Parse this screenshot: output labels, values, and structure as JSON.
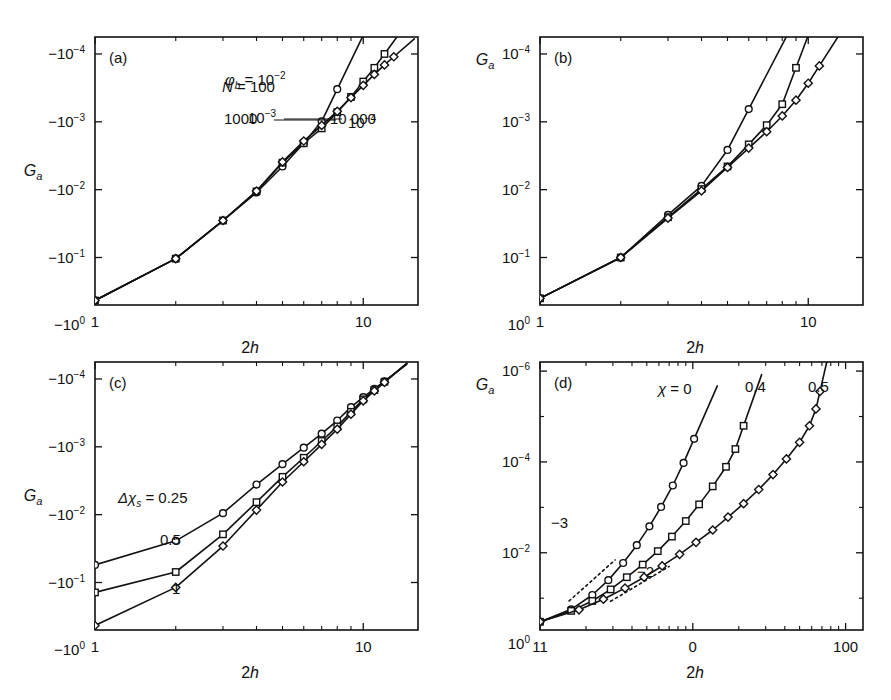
{
  "figure": {
    "background": "#ffffff",
    "ink": "#111111",
    "width": 891,
    "height": 700
  },
  "chart_data": [
    {
      "id": "panel-a",
      "type": "line",
      "tag": "(a)",
      "title": "",
      "xlabel": "2h",
      "ylabel": "Ga",
      "ylabel_parts": {
        "base": "G",
        "sub": "a"
      },
      "xscale": "log",
      "yscale": "log-negative",
      "xlim": [
        1,
        16
      ],
      "ylim_exp": [
        -0.3,
        -4.25
      ],
      "xticks": [
        1,
        10
      ],
      "xticklabels": [
        "1",
        "10"
      ],
      "yticks_exp": [
        0,
        -1,
        -2,
        -3,
        -4
      ],
      "yticklabels": [
        "-10^0",
        "-10^-1",
        "-10^-2",
        "-10^-3",
        "-10^-4"
      ],
      "grid": false,
      "legend_position": "inline-annotations",
      "annotations": [
        {
          "text": "φ",
          "sub": "b",
          "eq": " = 10",
          "sup": "-2",
          "x": 225,
          "y": 85
        },
        {
          "text": "10",
          "sup": "-3",
          "x": 248,
          "y": 123,
          "leader": true
        },
        {
          "text": "10",
          "sup": "-4",
          "x": 348,
          "y": 128
        }
      ],
      "series": [
        {
          "name": "phi_b = 1e-2",
          "marker": "circle",
          "label": "10^-2",
          "points": [
            [
              1,
              0.43
            ],
            [
              2,
              0.104
            ],
            [
              3,
              0.0285
            ],
            [
              4,
              0.011
            ],
            [
              5,
              0.00455
            ],
            [
              6,
              0.00207
            ],
            [
              7,
              0.000985
            ],
            [
              8,
              0.00033
            ]
          ]
        },
        {
          "name": "phi_b = 1e-3",
          "marker": "square",
          "label": "10^-3",
          "points": [
            [
              1,
              0.43
            ],
            [
              2,
              0.104
            ],
            [
              3,
              0.0285
            ],
            [
              4,
              0.0106
            ],
            [
              5,
              0.004
            ],
            [
              6,
              0.00207
            ],
            [
              7,
              0.00125
            ],
            [
              8,
              0.00072
            ],
            [
              9,
              0.00043
            ],
            [
              10,
              0.000255
            ],
            [
              11,
              0.00016
            ],
            [
              12,
              0.0001
            ]
          ]
        },
        {
          "name": "phi_b = 1e-4",
          "marker": "diamond",
          "label": "10^-4",
          "points": [
            [
              1,
              0.43
            ],
            [
              2,
              0.104
            ],
            [
              3,
              0.0285
            ],
            [
              4,
              0.0105
            ],
            [
              5,
              0.0039
            ],
            [
              6,
              0.00192
            ],
            [
              7,
              0.00113
            ],
            [
              8,
              0.0007
            ],
            [
              9,
              0.00044
            ],
            [
              10,
              0.00029
            ],
            [
              11,
              0.0002
            ],
            [
              12,
              0.000145
            ],
            [
              13,
              0.00011
            ]
          ]
        }
      ]
    },
    {
      "id": "panel-b",
      "type": "line",
      "tag": "(b)",
      "title": "",
      "xlabel": "2h",
      "ylabel": "Ga",
      "ylabel_parts": {
        "base": "G",
        "sub": "a"
      },
      "xscale": "log",
      "yscale": "log-negative",
      "xlim": [
        1,
        16
      ],
      "ylim_exp": [
        -0.3,
        -4.25
      ],
      "xticks": [
        1,
        10
      ],
      "xticklabels": [
        "1",
        "10"
      ],
      "yticks_exp": [
        0,
        -1,
        -2,
        -3,
        -4
      ],
      "yticklabels": [
        "10^0",
        "10^-1",
        "10^-2",
        "10^-3",
        "10^-4"
      ],
      "grid": false,
      "legend_position": "inline-annotations",
      "annotations": [
        {
          "text": "N",
          "eq": " = 100",
          "x": 222,
          "y": 92
        },
        {
          "text": "1000",
          "x": 224,
          "y": 124,
          "leader": true
        },
        {
          "text": "10 000",
          "x": 330,
          "y": 124
        }
      ],
      "series": [
        {
          "name": "N = 100",
          "marker": "circle",
          "label": "100",
          "points": [
            [
              1,
              0.4
            ],
            [
              2,
              0.1
            ],
            [
              3,
              0.0235
            ],
            [
              4,
              0.0088
            ],
            [
              5,
              0.0026
            ],
            [
              6,
              0.00065
            ]
          ]
        },
        {
          "name": "N = 1000",
          "marker": "square",
          "label": "1000",
          "points": [
            [
              1,
              0.4
            ],
            [
              2,
              0.1
            ],
            [
              3,
              0.0255
            ],
            [
              4,
              0.0098
            ],
            [
              5,
              0.00455
            ],
            [
              6,
              0.00215
            ],
            [
              7,
              0.00112
            ],
            [
              8,
              0.00055
            ],
            [
              9,
              0.00016
            ]
          ]
        },
        {
          "name": "N = 10000",
          "marker": "diamond",
          "label": "10 000",
          "points": [
            [
              1,
              0.4
            ],
            [
              2,
              0.1
            ],
            [
              3,
              0.0262
            ],
            [
              4,
              0.0104
            ],
            [
              5,
              0.0047
            ],
            [
              6,
              0.00244
            ],
            [
              7,
              0.0014
            ],
            [
              8,
              0.00082
            ],
            [
              9,
              0.00048
            ],
            [
              10,
              0.00027
            ],
            [
              11,
              0.00015
            ]
          ]
        }
      ]
    },
    {
      "id": "panel-c",
      "type": "line",
      "tag": "(c)",
      "title": "",
      "xlabel": "2h",
      "ylabel": "Ga",
      "ylabel_parts": {
        "base": "G",
        "sub": "a"
      },
      "xscale": "log",
      "yscale": "log-negative",
      "xlim": [
        1,
        16
      ],
      "ylim_exp": [
        -0.3,
        -4.25
      ],
      "xticks": [
        1,
        10
      ],
      "xticklabels": [
        "1",
        "10"
      ],
      "yticks_exp": [
        0,
        -1,
        -2,
        -3,
        -4
      ],
      "yticklabels": [
        "-10^0",
        "-10^-1",
        "-10^-2",
        "-10^-3",
        "-10^-4"
      ],
      "grid": false,
      "legend_position": "inline-annotations",
      "annotations": [
        {
          "text": "Δχ",
          "sub": "s",
          "eq": " = 0.25",
          "x": 118,
          "y": 503
        },
        {
          "text": "0.5",
          "x": 160,
          "y": 545
        },
        {
          "text": "1",
          "x": 172,
          "y": 594
        }
      ],
      "series": [
        {
          "name": "dchi_s = 0.25",
          "marker": "circle",
          "label": "0.25",
          "points": [
            [
              1,
              0.055
            ],
            [
              2,
              0.0243
            ],
            [
              3,
              0.0095
            ],
            [
              4,
              0.0036
            ],
            [
              5,
              0.0018
            ],
            [
              6,
              0.00103
            ],
            [
              7,
              0.00064
            ],
            [
              8,
              0.00041
            ],
            [
              9,
              0.00026
            ],
            [
              10,
              0.000185
            ],
            [
              11,
              0.00014
            ],
            [
              12,
              0.000108
            ]
          ]
        },
        {
          "name": "dchi_s = 0.5",
          "marker": "square",
          "label": "0.5",
          "points": [
            [
              1,
              0.14
            ],
            [
              2,
              0.07
            ],
            [
              3,
              0.0195
            ],
            [
              4,
              0.00655
            ],
            [
              5,
              0.00277
            ],
            [
              6,
              0.00145
            ],
            [
              7,
              0.00082
            ],
            [
              8,
              0.0005
            ],
            [
              9,
              0.000305
            ],
            [
              10,
              0.0002
            ],
            [
              11,
              0.000146
            ],
            [
              12,
              0.00011
            ]
          ]
        },
        {
          "name": "dchi_s = 1",
          "marker": "diamond",
          "label": "1",
          "points": [
            [
              1,
              0.43
            ],
            [
              2,
              0.118
            ],
            [
              3,
              0.029
            ],
            [
              4,
              0.00855
            ],
            [
              5,
              0.0033
            ],
            [
              6,
              0.00166
            ],
            [
              7,
              0.00092
            ],
            [
              8,
              0.00055
            ],
            [
              9,
              0.00033
            ],
            [
              10,
              0.00021
            ],
            [
              11,
              0.00015
            ],
            [
              12,
              0.000112
            ]
          ]
        }
      ]
    },
    {
      "id": "panel-d",
      "type": "line",
      "tag": "(d)",
      "title": "",
      "xlabel": "2h",
      "ylabel": "Ga",
      "ylabel_parts": {
        "base": "G",
        "sub": "a"
      },
      "xscale": "log",
      "yscale": "log-negative",
      "xlim": [
        1,
        130
      ],
      "ylim_exp": [
        -0.3,
        -6.2
      ],
      "xticks": [
        1,
        10,
        100
      ],
      "xticklabels": [
        "11",
        "0",
        "100"
      ],
      "yticks_exp": [
        0,
        -2,
        -4,
        -6
      ],
      "yticklabels": [
        "10^0",
        "10^-2",
        "10^-4",
        "10^-6"
      ],
      "grid": false,
      "legend_position": "inline-annotations",
      "annotations": [
        {
          "text": "χ",
          "eq": " = 0",
          "x": 658,
          "y": 394
        },
        {
          "text": "0.4",
          "x": 745,
          "y": 392
        },
        {
          "text": "0.5",
          "x": 808,
          "y": 392
        },
        {
          "text": "-3",
          "x": 551,
          "y": 528
        },
        {
          "text": "-2",
          "x": 637,
          "y": 577
        }
      ],
      "slope_guides": [
        {
          "label": "-3",
          "slope": -3,
          "x0": 1.55,
          "y0": 0.115,
          "x1": 3.1,
          "y1": 0.0144
        },
        {
          "label": "-2",
          "slope": -2,
          "x0": 2.9,
          "y0": 0.117,
          "x1": 7.0,
          "y1": 0.02
        }
      ],
      "series": [
        {
          "name": "chi = 0",
          "marker": "circle",
          "label": "0",
          "points": [
            [
              1,
              0.33
            ],
            [
              1.6,
              0.176
            ],
            [
              2.2,
              0.085
            ],
            [
              2.8,
              0.04
            ],
            [
              3.5,
              0.0168
            ],
            [
              4.3,
              0.0068
            ],
            [
              5.2,
              0.00262
            ],
            [
              6.2,
              0.00098
            ],
            [
              7.4,
              0.00033
            ],
            [
              8.7,
              0.000105
            ],
            [
              10.2,
              3.1e-05
            ]
          ]
        },
        {
          "name": "chi = 0.4",
          "marker": "square",
          "label": "0.4",
          "points": [
            [
              1,
              0.33
            ],
            [
              1.6,
              0.19
            ],
            [
              2.2,
              0.115
            ],
            [
              2.9,
              0.064
            ],
            [
              3.7,
              0.0345
            ],
            [
              4.7,
              0.0182
            ],
            [
              5.9,
              0.0092
            ],
            [
              7.3,
              0.0044
            ],
            [
              9.0,
              0.002
            ],
            [
              11.0,
              0.00086
            ],
            [
              13.5,
              0.000345
            ],
            [
              16.5,
              0.000128
            ],
            [
              19.0,
              5.2e-05
            ],
            [
              21.5,
              1.6e-05
            ]
          ]
        },
        {
          "name": "chi = 0.5",
          "marker": "diamond",
          "label": "0.5",
          "points": [
            [
              1,
              0.33
            ],
            [
              1.8,
              0.18
            ],
            [
              2.6,
              0.105
            ],
            [
              3.6,
              0.06
            ],
            [
              4.8,
              0.0345
            ],
            [
              6.3,
              0.0195
            ],
            [
              8.2,
              0.0108
            ],
            [
              10.5,
              0.0059
            ],
            [
              13.5,
              0.00315
            ],
            [
              17.0,
              0.00164
            ],
            [
              21.5,
              0.00083
            ],
            [
              27.0,
              0.000405
            ],
            [
              33.5,
              0.00019
            ],
            [
              41.0,
              8.6e-05
            ],
            [
              50.0,
              3.7e-05
            ],
            [
              58.0,
              1.6e-05
            ],
            [
              64.0,
              6.8e-06
            ],
            [
              68.0,
              2.8e-06
            ]
          ]
        }
      ]
    }
  ]
}
